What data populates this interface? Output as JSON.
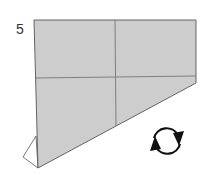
{
  "diagram": {
    "type": "origami-step",
    "step_number": "5",
    "colors": {
      "paper_fill": "#cdcdcd",
      "edge": "#555555",
      "crease": "#6b6b6b",
      "arrow": "#111111",
      "background": "#ffffff"
    },
    "symbols": [
      "turn-over-arrow"
    ]
  }
}
